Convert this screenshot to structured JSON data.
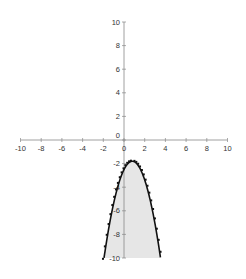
{
  "chart_data": {
    "type": "line",
    "title": "",
    "xlabel": "",
    "ylabel": "",
    "xlim": [
      -10,
      10
    ],
    "ylim": [
      -10,
      10
    ],
    "x_ticks": [
      "-10",
      "-8",
      "-6",
      "-4",
      "-2",
      "0",
      "2",
      "4",
      "6",
      "8",
      "10"
    ],
    "y_ticks": [
      "10",
      "8",
      "6",
      "4",
      "2",
      "0",
      "-2",
      "-4",
      "-6",
      "-8",
      "-10"
    ],
    "grid": false,
    "legend": null,
    "series": [
      {
        "name": "fitted curve",
        "style": "solid black line, area below shaded light gray",
        "function": "y = -1.1*(x-0.8)^2 - 1.8",
        "x": [
          -1.9,
          -1.5,
          -1,
          -0.5,
          0,
          0.4,
          0.8,
          1.2,
          1.6,
          2,
          2.5,
          3,
          3.5,
          3.6
        ],
        "y": [
          -10,
          -7.6,
          -5.4,
          -3.7,
          -2.5,
          -2.0,
          -1.8,
          -2.0,
          -2.5,
          -3.4,
          -5.0,
          -7.1,
          -9.8,
          -10
        ]
      },
      {
        "name": "data points",
        "style": "small black squares (dotted)",
        "x": [
          -1.9,
          -1.5,
          -1,
          -0.5,
          0,
          0.4,
          0.8,
          1.2,
          1.6,
          2,
          2.5,
          3,
          3.5
        ],
        "y": [
          -10,
          -7.5,
          -5.3,
          -3.6,
          -2.4,
          -1.9,
          -1.7,
          -1.9,
          -2.4,
          -3.3,
          -4.9,
          -7.0,
          -9.7
        ]
      }
    ]
  }
}
